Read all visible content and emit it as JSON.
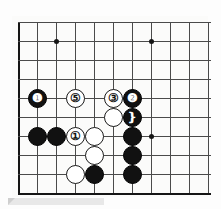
{
  "diagram": {
    "type": "go-board-diagram",
    "board": {
      "background_color": "#fbfbfa",
      "line_color": "#4a4a4a",
      "edge_color": "#151515",
      "columns": 11,
      "rows": 10,
      "cell_size": 19,
      "origin_x": 18,
      "origin_y": 22,
      "left_edge": true,
      "top_edge": true,
      "bottom_edge": true,
      "right_edge_cropped": true
    },
    "star_points": [
      {
        "name": "star-point-upper-left",
        "col": 2,
        "row": 1
      },
      {
        "name": "star-point-upper-right",
        "col": 7,
        "row": 1
      },
      {
        "name": "star-point-right",
        "col": 7,
        "row": 6
      }
    ],
    "stones": [
      {
        "id": "stone-6",
        "color": "black",
        "label": "❶",
        "col": 1,
        "row": 4
      },
      {
        "id": "stone-5",
        "color": "white",
        "label": "⑤",
        "col": 3,
        "row": 4
      },
      {
        "id": "stone-3",
        "color": "white",
        "label": "③",
        "col": 5,
        "row": 4
      },
      {
        "id": "stone-4",
        "color": "black",
        "label": "❷",
        "col": 6,
        "row": 4
      },
      {
        "id": "stone-white-a",
        "color": "white",
        "label": "",
        "col": 5,
        "row": 5
      },
      {
        "id": "stone-2",
        "color": "black",
        "label": "❵",
        "col": 6,
        "row": 5
      },
      {
        "id": "stone-black-b",
        "color": "black",
        "label": "",
        "col": 1,
        "row": 6
      },
      {
        "id": "stone-black-c",
        "color": "black",
        "label": "",
        "col": 2,
        "row": 6
      },
      {
        "id": "stone-1",
        "color": "white",
        "label": "①",
        "col": 3,
        "row": 6
      },
      {
        "id": "stone-white-d",
        "color": "white",
        "label": "",
        "col": 4,
        "row": 6
      },
      {
        "id": "stone-black-e",
        "color": "black",
        "label": "",
        "col": 6,
        "row": 6
      },
      {
        "id": "stone-white-f",
        "color": "white",
        "label": "",
        "col": 4,
        "row": 7
      },
      {
        "id": "stone-black-g",
        "color": "black",
        "label": "",
        "col": 6,
        "row": 7
      },
      {
        "id": "stone-white-h",
        "color": "white",
        "label": "",
        "col": 3,
        "row": 8
      },
      {
        "id": "stone-black-i",
        "color": "black",
        "label": "",
        "col": 4,
        "row": 8
      },
      {
        "id": "stone-black-j",
        "color": "black",
        "label": "",
        "col": 6,
        "row": 8
      }
    ]
  }
}
